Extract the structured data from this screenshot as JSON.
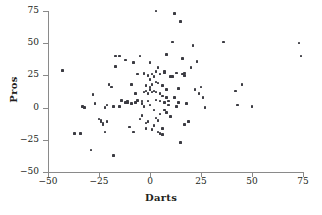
{
  "chart_data": {
    "type": "scatter",
    "title": "",
    "xlabel": "Darts",
    "ylabel": "Pros",
    "xlim": [
      -50,
      75
    ],
    "ylim": [
      -50,
      75
    ],
    "xticks": [
      -50,
      -25,
      0,
      25,
      50,
      75
    ],
    "yticks": [
      -50,
      -25,
      0,
      25,
      50,
      75
    ],
    "xtick_labels": [
      "−50",
      "−25",
      "0",
      "25",
      "50",
      "75"
    ],
    "ytick_labels": [
      "−50",
      "−25",
      "0",
      "25",
      "50",
      "75"
    ],
    "grid": false,
    "legend": null,
    "marker_color": "#3b3b42",
    "axis_color": "#8a8a8a",
    "n_points": 112,
    "points": [
      [
        -43,
        29
      ],
      [
        -37,
        -20
      ],
      [
        -34,
        -20
      ],
      [
        -33,
        1
      ],
      [
        -32,
        0
      ],
      [
        -29,
        -33
      ],
      [
        -28,
        10
      ],
      [
        -27,
        3
      ],
      [
        -25,
        -9
      ],
      [
        -24,
        -10
      ],
      [
        -24,
        -11
      ],
      [
        -23,
        -12
      ],
      [
        -23,
        -13
      ],
      [
        -22,
        0
      ],
      [
        -22,
        -19
      ],
      [
        -21,
        2
      ],
      [
        -21,
        -11
      ],
      [
        -20,
        18
      ],
      [
        -19,
        16
      ],
      [
        -18,
        1
      ],
      [
        -18,
        -37
      ],
      [
        -17,
        40
      ],
      [
        -17,
        32
      ],
      [
        -15,
        40
      ],
      [
        -15,
        1
      ],
      [
        -14,
        5
      ],
      [
        -14,
        6
      ],
      [
        -12,
        37
      ],
      [
        -12,
        4
      ],
      [
        -11,
        4
      ],
      [
        -11,
        5
      ],
      [
        -10,
        -15
      ],
      [
        -9,
        18
      ],
      [
        -9,
        3
      ],
      [
        -8,
        35
      ],
      [
        -8,
        -19
      ],
      [
        -7,
        11
      ],
      [
        -7,
        4
      ],
      [
        -6,
        26
      ],
      [
        -6,
        5
      ],
      [
        -6,
        6
      ],
      [
        -5,
        40
      ],
      [
        -5,
        -9
      ],
      [
        -4,
        3
      ],
      [
        -4,
        5
      ],
      [
        -4,
        -6
      ],
      [
        -3,
        27
      ],
      [
        -3,
        26
      ],
      [
        -3,
        12
      ],
      [
        -3,
        1
      ],
      [
        -2,
        17
      ],
      [
        -2,
        13
      ],
      [
        -2,
        -12
      ],
      [
        -2,
        -16
      ],
      [
        -1,
        25
      ],
      [
        -1,
        11
      ],
      [
        -1,
        5
      ],
      [
        -1,
        -11
      ],
      [
        0,
        35
      ],
      [
        0,
        22
      ],
      [
        0,
        16
      ],
      [
        0,
        14
      ],
      [
        0,
        2
      ],
      [
        1,
        26
      ],
      [
        1,
        18
      ],
      [
        1,
        12
      ],
      [
        1,
        -17
      ],
      [
        2,
        24
      ],
      [
        2,
        13
      ],
      [
        2,
        -2
      ],
      [
        2,
        -14
      ],
      [
        3,
        75
      ],
      [
        3,
        28
      ],
      [
        3,
        20
      ],
      [
        3,
        12
      ],
      [
        3,
        6
      ],
      [
        3,
        -8
      ],
      [
        4,
        31
      ],
      [
        4,
        19
      ],
      [
        4,
        -10
      ],
      [
        4,
        -19
      ],
      [
        5,
        26
      ],
      [
        5,
        11
      ],
      [
        5,
        5
      ],
      [
        5,
        -5
      ],
      [
        5,
        -20
      ],
      [
        6,
        17
      ],
      [
        6,
        9
      ],
      [
        6,
        -16
      ],
      [
        6,
        -21
      ],
      [
        7,
        28
      ],
      [
        7,
        27
      ],
      [
        7,
        4
      ],
      [
        7,
        -2
      ],
      [
        8,
        41
      ],
      [
        8,
        14
      ],
      [
        8,
        8
      ],
      [
        8,
        -4
      ],
      [
        9,
        5
      ],
      [
        9,
        2
      ],
      [
        10,
        24
      ],
      [
        10,
        -7
      ],
      [
        11,
        51
      ],
      [
        11,
        24
      ],
      [
        12,
        73
      ],
      [
        12,
        8
      ],
      [
        13,
        27
      ],
      [
        13,
        1
      ],
      [
        14,
        15
      ],
      [
        14,
        4
      ],
      [
        15,
        67
      ],
      [
        15,
        -27
      ],
      [
        16,
        38
      ],
      [
        16,
        26
      ],
      [
        17,
        25
      ],
      [
        17,
        27
      ],
      [
        17,
        -13
      ],
      [
        18,
        3
      ],
      [
        19,
        -11
      ],
      [
        20,
        31
      ],
      [
        21,
        48
      ],
      [
        22,
        14
      ],
      [
        23,
        36
      ],
      [
        24,
        11
      ],
      [
        25,
        16
      ],
      [
        26,
        8
      ],
      [
        27,
        0
      ],
      [
        36,
        51
      ],
      [
        42,
        13
      ],
      [
        43,
        2
      ],
      [
        45,
        18
      ],
      [
        50,
        1
      ],
      [
        73,
        50
      ],
      [
        74,
        40
      ]
    ]
  },
  "labels": {
    "x_title": "Darts",
    "y_title": "Pros",
    "title_remnant": ""
  }
}
